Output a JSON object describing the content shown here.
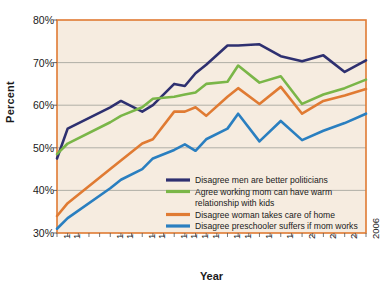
{
  "chart_data": {
    "type": "line",
    "title": "",
    "xlabel": "Year",
    "ylabel": "Percent",
    "ylim": [
      30,
      80
    ],
    "yticks": [
      "30%",
      "40%",
      "50%",
      "60%",
      "70%",
      "80%"
    ],
    "ytick_values": [
      30,
      40,
      50,
      60,
      70,
      80
    ],
    "grid": true,
    "legend_position": "inside-lower-right",
    "x": [
      1977,
      1978,
      1982,
      1983,
      1985,
      1986,
      1988,
      1989,
      1990,
      1991,
      1993,
      1994,
      1996,
      1998,
      2000,
      2002,
      2004,
      2006
    ],
    "categories": [
      "1977",
      "1978",
      "1982",
      "1983",
      "1985",
      "1986",
      "1988",
      "1989",
      "1990",
      "1991",
      "1993",
      "1994",
      "1996",
      "1998",
      "2000",
      "2002",
      "2004",
      "2006"
    ],
    "xtick_labels": [
      "1977",
      "1978",
      "1982",
      "1983",
      "1985",
      "1986",
      "1988",
      "1989",
      "1990",
      "1991",
      "1993",
      "1994",
      "1996",
      "1998",
      "2000",
      "2002",
      "2004",
      "2006"
    ],
    "series": [
      {
        "name": "Disagree men are better politicians",
        "color": "#2e3070",
        "values": [
          47.5,
          54.5,
          59.5,
          61.0,
          58.5,
          60.0,
          65.0,
          64.5,
          67.5,
          69.5,
          74.0,
          74.0,
          74.3,
          71.5,
          70.3,
          71.7,
          67.8,
          70.5
        ]
      },
      {
        "name": "Agree working mom can have warm relationship with kids",
        "color": "#7ab648",
        "values": [
          48.5,
          51.0,
          56.0,
          57.5,
          59.5,
          61.5,
          62.0,
          62.5,
          63.0,
          65.0,
          65.5,
          69.3,
          65.3,
          66.8,
          60.3,
          62.5,
          64.0,
          66.0
        ]
      },
      {
        "name": "Disagree woman takes care of home",
        "color": "#e07b33",
        "values": [
          34.0,
          37.0,
          45.0,
          47.0,
          51.0,
          52.0,
          58.5,
          58.5,
          59.5,
          57.5,
          62.0,
          64.0,
          60.3,
          64.3,
          58.0,
          61.0,
          62.3,
          63.8
        ]
      },
      {
        "name": "Disagree preschooler suffers if mom works",
        "color": "#2a7fc0",
        "values": [
          31.0,
          33.5,
          40.5,
          42.5,
          45.0,
          47.5,
          49.5,
          50.8,
          49.3,
          52.0,
          54.5,
          58.0,
          51.5,
          56.3,
          51.8,
          54.0,
          55.8,
          58.0
        ]
      }
    ],
    "legend": [
      {
        "label": "Disagree men are better politicians",
        "color": "#2e3070"
      },
      {
        "label": "Agree working mom can have warm",
        "label2": "relationship with kids",
        "color": "#7ab648"
      },
      {
        "label": "Disagree woman takes care of home",
        "color": "#e07b33"
      },
      {
        "label": "Disagree preschooler suffers if mom works",
        "color": "#2a7fc0"
      }
    ],
    "plot_background": "#f6ece0",
    "frame_color": "#e07b33",
    "grid_color": "#a8a8a0"
  }
}
